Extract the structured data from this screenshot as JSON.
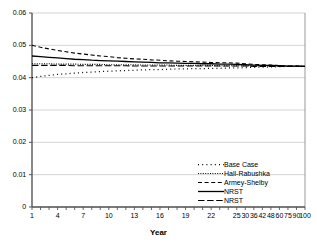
{
  "chart_data": {
    "type": "line",
    "title": "",
    "xlabel": "Year",
    "ylabel": "",
    "grid": true,
    "legend_position": "bottom-right",
    "ylim": [
      0,
      0.06
    ],
    "yticks": [
      "0",
      "0.01",
      "0.02",
      "0.03",
      "0.04",
      "0.05",
      "0.06"
    ],
    "ytick_values": [
      0,
      0.01,
      0.02,
      0.03,
      0.04,
      0.05,
      0.06
    ],
    "x_axis_type": "categorical",
    "categories": [
      1,
      2,
      3,
      4,
      5,
      6,
      7,
      8,
      9,
      10,
      11,
      12,
      13,
      14,
      15,
      16,
      17,
      18,
      19,
      20,
      21,
      22,
      23,
      24,
      25,
      30,
      36,
      42,
      48,
      60,
      75,
      90,
      100
    ],
    "xtick_labels": [
      "1",
      "",
      "",
      "4",
      "",
      "",
      "7",
      "",
      "",
      "10",
      "",
      "",
      "13",
      "",
      "",
      "16",
      "",
      "",
      "19",
      "",
      "",
      "22",
      "",
      "",
      "25",
      "30",
      "36",
      "42",
      "48",
      "60",
      "75",
      "90",
      "100"
    ],
    "series": [
      {
        "name": "Base Case",
        "style": "dotted-sparse",
        "color": "#000000",
        "values": [
          0.04,
          0.0404,
          0.0407,
          0.041,
          0.0412,
          0.0414,
          0.0416,
          0.0417,
          0.0419,
          0.042,
          0.0421,
          0.0422,
          0.0423,
          0.0424,
          0.0425,
          0.0425,
          0.0426,
          0.0427,
          0.0427,
          0.0428,
          0.0428,
          0.0429,
          0.0429,
          0.043,
          0.043,
          0.0431,
          0.0432,
          0.0433,
          0.0433,
          0.0434,
          0.0435,
          0.0435,
          0.0435
        ]
      },
      {
        "name": "Hall-Rabushka",
        "style": "dotted-fine",
        "color": "#000000",
        "values": [
          0.0443,
          0.0443,
          0.0443,
          0.0442,
          0.0442,
          0.0442,
          0.0441,
          0.0441,
          0.0441,
          0.044,
          0.044,
          0.044,
          0.044,
          0.0439,
          0.0439,
          0.0439,
          0.0439,
          0.0438,
          0.0438,
          0.0438,
          0.0438,
          0.0438,
          0.0437,
          0.0437,
          0.0437,
          0.0437,
          0.0436,
          0.0436,
          0.0436,
          0.0436,
          0.0435,
          0.0435,
          0.0435
        ]
      },
      {
        "name": "Armey-Shelby",
        "style": "dashed-medium",
        "color": "#000000",
        "values": [
          0.05,
          0.0494,
          0.0489,
          0.0484,
          0.048,
          0.0476,
          0.0473,
          0.047,
          0.0467,
          0.0465,
          0.0462,
          0.046,
          0.0458,
          0.0457,
          0.0455,
          0.0454,
          0.0452,
          0.0451,
          0.045,
          0.0449,
          0.0448,
          0.0447,
          0.0446,
          0.0446,
          0.0445,
          0.0443,
          0.0441,
          0.044,
          0.0439,
          0.0437,
          0.0436,
          0.0436,
          0.0435
        ]
      },
      {
        "name": "NRST",
        "style": "solid",
        "color": "#000000",
        "values": [
          0.0467,
          0.0465,
          0.0463,
          0.0461,
          0.0459,
          0.0457,
          0.0456,
          0.0454,
          0.0453,
          0.0452,
          0.0451,
          0.045,
          0.0449,
          0.0448,
          0.0447,
          0.0446,
          0.0446,
          0.0445,
          0.0444,
          0.0444,
          0.0443,
          0.0443,
          0.0442,
          0.0442,
          0.0441,
          0.044,
          0.0439,
          0.0438,
          0.0438,
          0.0437,
          0.0436,
          0.0436,
          0.0435
        ]
      },
      {
        "name": "NRST",
        "style": "dashed-long",
        "color": "#000000",
        "values": [
          0.0438,
          0.0438,
          0.0438,
          0.0438,
          0.0438,
          0.0437,
          0.0437,
          0.0437,
          0.0437,
          0.0437,
          0.0437,
          0.0437,
          0.0436,
          0.0436,
          0.0436,
          0.0436,
          0.0436,
          0.0436,
          0.0436,
          0.0436,
          0.0436,
          0.0436,
          0.0436,
          0.0436,
          0.0436,
          0.0436,
          0.0435,
          0.0435,
          0.0435,
          0.0435,
          0.0435,
          0.0435,
          0.0435
        ]
      }
    ]
  },
  "axis": {
    "x_title": "Year"
  },
  "colors": {
    "grid": "#c8c8c8",
    "axis": "#555555",
    "line": "#000000",
    "background": "#ffffff"
  }
}
